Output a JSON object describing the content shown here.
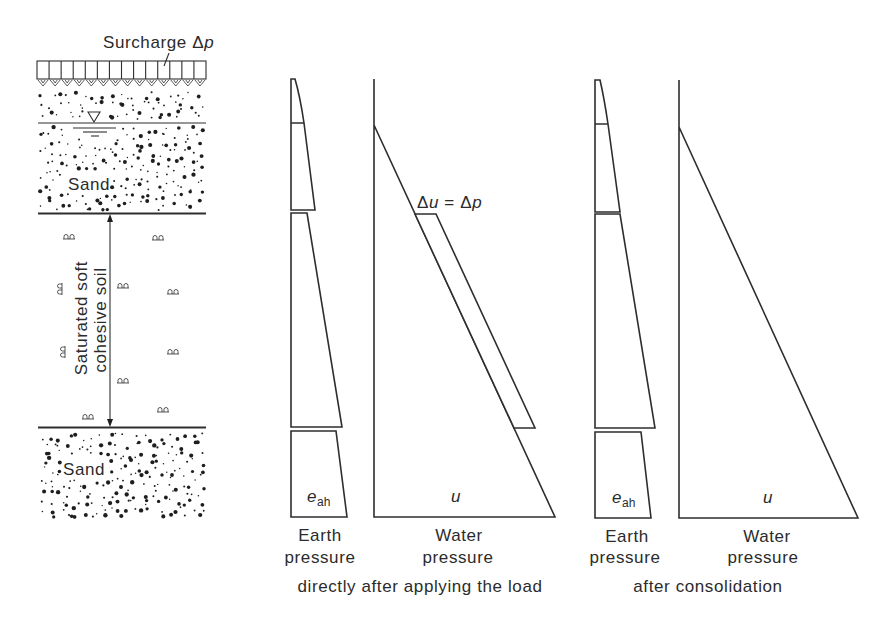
{
  "colors": {
    "line": "#2e2e2e",
    "text": "#2b2b2b",
    "background": "#ffffff"
  },
  "figure": {
    "soil_profile": {
      "surcharge_label": {
        "text": "Surcharge Δ",
        "var": "p"
      },
      "upper_layer_label": "Sand",
      "middle_layer_label": {
        "line1": "Saturated soft",
        "line2": "cohesive soil"
      },
      "lower_layer_label": "Sand",
      "water_table_symbol": "groundwater-level-triangle"
    },
    "panels": [
      {
        "caption": "directly after applying the load",
        "earth": {
          "title_line1": "Earth",
          "title_line2": "pressure",
          "symbol": "e",
          "subscript": "ah"
        },
        "water": {
          "title_line1": "Water",
          "title_line2": "pressure",
          "symbol": "u"
        },
        "annotation": {
          "prefix": "Δ",
          "var1": "u",
          "mid": " = Δ",
          "var2": "p"
        }
      },
      {
        "caption": "after consolidation",
        "earth": {
          "title_line1": "Earth",
          "title_line2": "pressure",
          "symbol": "e",
          "subscript": "ah"
        },
        "water": {
          "title_line1": "Water",
          "title_line2": "pressure",
          "symbol": "u"
        }
      }
    ]
  },
  "geometry": {
    "surcharge": {
      "x": 37,
      "y": 61,
      "w": 169,
      "h": 18,
      "cells": 14
    },
    "sand_upper": {
      "x0": 40,
      "y0": 92,
      "x1": 204,
      "y1": 210,
      "exclude": [
        [
          86,
          108,
          102,
          124
        ],
        [
          36,
          119,
          210,
          127
        ],
        [
          70,
          124,
          120,
          139
        ],
        [
          64,
          170,
          112,
          193
        ]
      ]
    },
    "sand_lower": {
      "x0": 40,
      "y0": 433,
      "x1": 204,
      "y1": 518,
      "exclude": [
        [
          60,
          456,
          108,
          480
        ]
      ]
    },
    "clay_symbols": [
      {
        "x": 69,
        "y": 237,
        "rot": 0
      },
      {
        "x": 158,
        "y": 238,
        "rot": 0
      },
      {
        "x": 60,
        "y": 289,
        "rot": -90
      },
      {
        "x": 123,
        "y": 286,
        "rot": 0
      },
      {
        "x": 173,
        "y": 292,
        "rot": 0
      },
      {
        "x": 63,
        "y": 352,
        "rot": -90
      },
      {
        "x": 173,
        "y": 352,
        "rot": 0
      },
      {
        "x": 123,
        "y": 381,
        "rot": 0
      },
      {
        "x": 88,
        "y": 417,
        "rot": 0
      },
      {
        "x": 163,
        "y": 410,
        "rot": 0
      }
    ],
    "panel_a": {
      "earth_top": "M291,210 L291,79 L295,79 Q300,96 304,123 L315,210 Z",
      "earth_top_divider": "M291,123 L304,123",
      "earth_mid": "291,213 307,213 342,427 291,427",
      "earth_bottom": "291,431 336,431 347,517 291,517",
      "water": "M374,79 L374,517 L555,517 L374,125",
      "excess_band": "415,214 436,214 535,428 514,428"
    },
    "panel_b": {
      "earth_top": "M595,212 L595,80 L600,80 Q604,97 608,124 L620,212 Z",
      "earth_top_divider": "M595,124 L608,124",
      "earth_mid": "595,214 620,214 655,428 595,428",
      "earth_bottom": "595,432 641,432 651,518 595,518",
      "water": "M679,80 L679,518 L858,518 L679,127"
    }
  }
}
